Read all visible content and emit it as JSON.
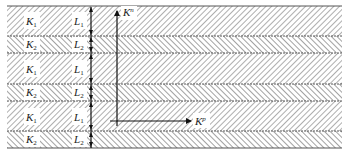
{
  "diagram": {
    "type": "layered-strata",
    "colors": {
      "background": "#ffffff",
      "hatch": "#9a9a9a",
      "boundary": "#555555",
      "arrow": "#111111",
      "label_box": "#ffffff"
    },
    "layers": [
      {
        "perm_label": "K",
        "perm_sub": "1",
        "thick_label": "L",
        "thick_sub": "1",
        "hatch": "forward"
      },
      {
        "perm_label": "K",
        "perm_sub": "2",
        "thick_label": "L",
        "thick_sub": "2",
        "hatch": "backward"
      },
      {
        "perm_label": "K",
        "perm_sub": "1",
        "thick_label": "L",
        "thick_sub": "1",
        "hatch": "forward"
      },
      {
        "perm_label": "K",
        "perm_sub": "2",
        "thick_label": "L",
        "thick_sub": "2",
        "hatch": "backward"
      },
      {
        "perm_label": "K",
        "perm_sub": "1",
        "thick_label": "L",
        "thick_sub": "1",
        "hatch": "forward"
      },
      {
        "perm_label": "K",
        "perm_sub": "2",
        "thick_label": "L",
        "thick_sub": "2",
        "hatch": "backward"
      }
    ],
    "axes": {
      "normal": {
        "label": "K",
        "sup": "n"
      },
      "parallel": {
        "label": "K",
        "sup": "p"
      }
    }
  }
}
